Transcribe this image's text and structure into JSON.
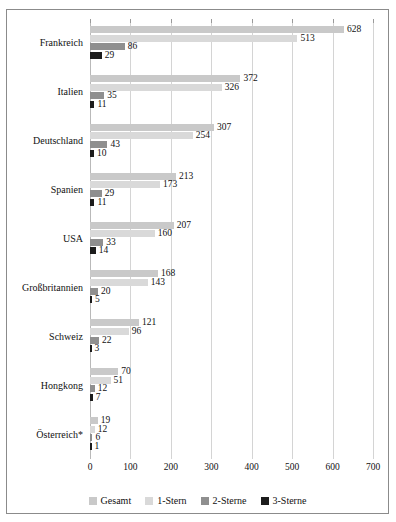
{
  "chart_data": {
    "type": "bar",
    "orientation": "horizontal",
    "title": "",
    "xlabel": "",
    "ylabel": "",
    "xlim": [
      0,
      700
    ],
    "xticks": [
      0,
      100,
      200,
      300,
      400,
      500,
      600,
      700
    ],
    "grid": true,
    "legend_position": "bottom",
    "categories": [
      "Frankreich",
      "Italien",
      "Deutschland",
      "Spanien",
      "USA",
      "Großbritannien",
      "Schweiz",
      "Hongkong",
      "Österreich*"
    ],
    "series": [
      {
        "name": "Gesamt",
        "color": "#c9c9c9",
        "values": [
          628,
          372,
          307,
          213,
          207,
          168,
          121,
          70,
          19
        ]
      },
      {
        "name": "1-Stern",
        "color": "#d9d9d9",
        "values": [
          513,
          326,
          254,
          173,
          160,
          143,
          96,
          51,
          12
        ]
      },
      {
        "name": "2-Sterne",
        "color": "#8f8f8f",
        "values": [
          86,
          35,
          43,
          29,
          33,
          20,
          22,
          12,
          6
        ]
      },
      {
        "name": "3-Sterne",
        "color": "#1c1c1c",
        "values": [
          29,
          11,
          10,
          11,
          14,
          5,
          3,
          7,
          1
        ]
      }
    ]
  },
  "legend": {
    "items": [
      {
        "label": "Gesamt"
      },
      {
        "label": "1-Stern"
      },
      {
        "label": "2-Sterne"
      },
      {
        "label": "3-Sterne"
      }
    ]
  }
}
